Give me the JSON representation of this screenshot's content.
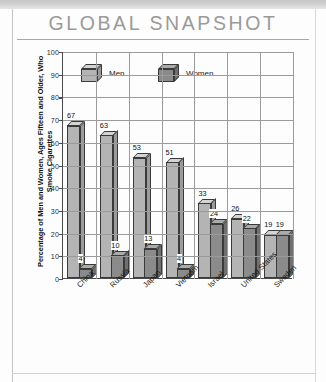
{
  "page": {
    "title": "GLOBAL SNAPSHOT"
  },
  "chart_data": {
    "type": "bar",
    "title": "GLOBAL SNAPSHOT",
    "xlabel": "",
    "ylabel": "Percentage of Men and Women, Ages Fifteen and Older, Who Smoke Cigarettes",
    "ylim": [
      0,
      100
    ],
    "ytick_step": 10,
    "yticks": [
      "0",
      "10",
      "20",
      "30",
      "40",
      "50",
      "60",
      "70",
      "80",
      "90",
      "100"
    ],
    "grid": true,
    "legend_position": "top-left-inside",
    "categories": [
      "China",
      "Russia",
      "Japan",
      "Vietnam",
      "Israel",
      "United States",
      "Sweden"
    ],
    "series": [
      {
        "name": "Men",
        "color": "#b4b4b4",
        "values": [
          67,
          63,
          53,
          51,
          33,
          26,
          19
        ]
      },
      {
        "name": "Women",
        "color": "#8b8b8b",
        "values": [
          4,
          10,
          13,
          4,
          24,
          22,
          19
        ]
      }
    ],
    "value_labels": {
      "men": [
        "67",
        "63",
        "53",
        "51",
        "33",
        "26",
        "19"
      ],
      "women": [
        "4",
        "10",
        "13",
        "4",
        "24",
        "22",
        "19"
      ]
    }
  }
}
